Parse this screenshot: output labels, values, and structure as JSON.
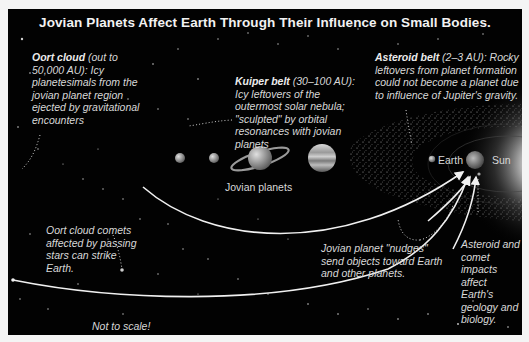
{
  "title": "Jovian Planets Affect Earth Through Their Influence on Small Bodies.",
  "captions": {
    "oort_cloud": {
      "bold": "Oort cloud",
      "text": " (out to 50,000 AU): Icy planetesimals from the jovian planet region ejected by gravitational encounters"
    },
    "kuiper_belt": {
      "bold": "Kuiper belt",
      "text": " (30–100 AU): Icy leftovers of the outermost solar nebula; \"sculpted\" by orbital resonances with jovian planets"
    },
    "asteroid_belt": {
      "bold": "Asteroid belt",
      "text": " (2–3 AU): Rocky leftovers from planet formation could not become a planet due to influence of Jupiter's gravity."
    },
    "oort_comets": "Oort cloud comets affected by passing stars can strike Earth.",
    "nudges": "Jovian planet \"nudges\" send objects toward Earth and other planets.",
    "impacts": "Asteroid and comet impacts affect Earth's geology and biology.",
    "not_to_scale": "Not to scale!"
  },
  "labels": {
    "jovian_planets": "Jovian planets",
    "earth": "Earth",
    "sun": "Sun"
  },
  "colors": {
    "background": "#020202",
    "text": "#d8d8d8",
    "arrow": "#f0f0f0"
  }
}
